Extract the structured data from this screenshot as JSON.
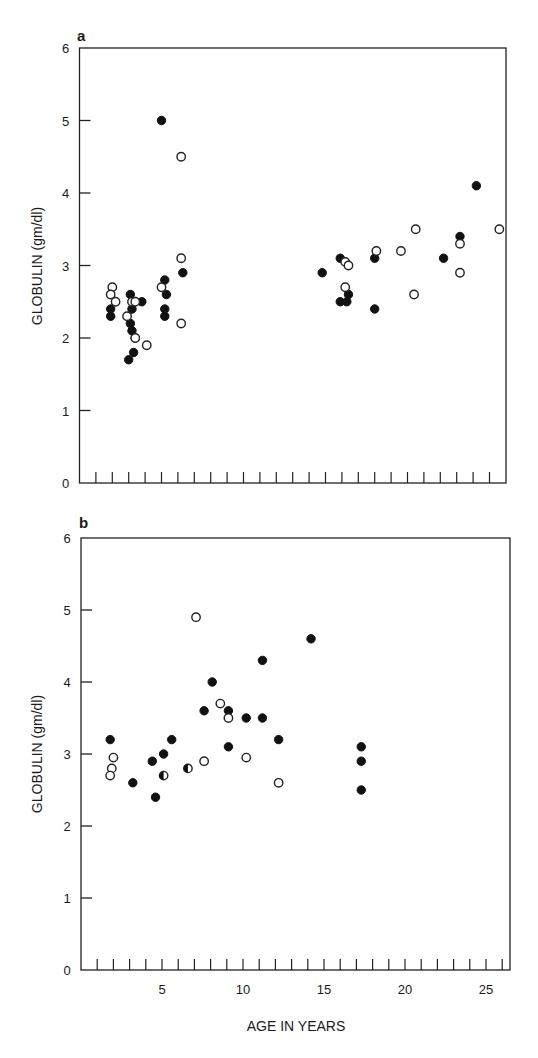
{
  "chart_data": [
    {
      "panel": "a",
      "type": "scatter",
      "title": "a",
      "xlabel": "",
      "ylabel": "GLOBULIN (gm/dl)",
      "xlim": [
        0,
        26.2
      ],
      "ylim": [
        0,
        6
      ],
      "yticks": [
        0,
        1,
        2,
        3,
        4,
        5,
        6
      ],
      "xticks_minor_every": 1,
      "grid": false,
      "series": [
        {
          "name": "filled",
          "marker": "filled-circle",
          "points": [
            [
              1.9,
              2.4
            ],
            [
              1.9,
              2.3
            ],
            [
              3.1,
              2.6
            ],
            [
              3.8,
              2.5
            ],
            [
              3.2,
              2.4
            ],
            [
              3.1,
              2.2
            ],
            [
              3.2,
              2.1
            ],
            [
              3.4,
              2.0
            ],
            [
              3.3,
              1.8
            ],
            [
              3.0,
              1.7
            ],
            [
              5.0,
              5.0
            ],
            [
              6.3,
              2.9
            ],
            [
              5.2,
              2.8
            ],
            [
              5.3,
              2.6
            ],
            [
              5.2,
              2.4
            ],
            [
              5.2,
              2.3
            ],
            [
              14.8,
              2.9
            ],
            [
              15.9,
              3.1
            ],
            [
              16.4,
              2.6
            ],
            [
              15.9,
              2.5
            ],
            [
              16.3,
              2.5
            ],
            [
              18.0,
              3.1
            ],
            [
              18.0,
              2.4
            ],
            [
              22.2,
              3.1
            ],
            [
              23.2,
              3.4
            ],
            [
              24.2,
              4.1
            ]
          ]
        },
        {
          "name": "open",
          "marker": "open-circle",
          "points": [
            [
              2.0,
              2.7
            ],
            [
              1.9,
              2.6
            ],
            [
              2.2,
              2.5
            ],
            [
              3.2,
              2.5
            ],
            [
              3.4,
              2.5
            ],
            [
              2.9,
              2.3
            ],
            [
              3.4,
              2.0
            ],
            [
              4.1,
              1.9
            ],
            [
              6.2,
              4.5
            ],
            [
              6.2,
              3.1
            ],
            [
              5.0,
              2.7
            ],
            [
              6.2,
              2.2
            ],
            [
              16.2,
              3.05
            ],
            [
              16.4,
              3.0
            ],
            [
              16.2,
              2.7
            ],
            [
              18.1,
              3.2
            ],
            [
              19.6,
              3.2
            ],
            [
              20.5,
              3.5
            ],
            [
              20.4,
              2.6
            ],
            [
              23.2,
              3.3
            ],
            [
              23.2,
              2.9
            ],
            [
              25.6,
              3.5
            ]
          ]
        }
      ]
    },
    {
      "panel": "b",
      "type": "scatter",
      "title": "b",
      "xlabel": "AGE IN YEARS",
      "ylabel": "GLOBULIN (gm/dl)",
      "xlim": [
        0,
        26.5
      ],
      "ylim": [
        0,
        6
      ],
      "yticks": [
        0,
        1,
        2,
        3,
        4,
        5,
        6
      ],
      "xtick_labels": [
        5,
        10,
        15,
        20,
        25
      ],
      "grid": false,
      "series": [
        {
          "name": "filled",
          "marker": "filled-circle",
          "points": [
            [
              1.8,
              3.2
            ],
            [
              3.2,
              2.6
            ],
            [
              4.4,
              2.9
            ],
            [
              5.1,
              3.0
            ],
            [
              5.6,
              3.2
            ],
            [
              4.6,
              2.4
            ],
            [
              7.6,
              3.6
            ],
            [
              8.1,
              4.0
            ],
            [
              9.1,
              3.6
            ],
            [
              9.1,
              3.1
            ],
            [
              10.2,
              3.5
            ],
            [
              11.2,
              3.5
            ],
            [
              11.2,
              4.3
            ],
            [
              12.2,
              3.2
            ],
            [
              14.2,
              4.6
            ],
            [
              17.3,
              3.1
            ],
            [
              17.3,
              2.9
            ],
            [
              17.3,
              2.5
            ]
          ]
        },
        {
          "name": "open",
          "marker": "open-circle",
          "points": [
            [
              2.0,
              2.95
            ],
            [
              1.9,
              2.8
            ],
            [
              1.8,
              2.7
            ],
            [
              7.6,
              2.9
            ],
            [
              7.1,
              4.9
            ],
            [
              8.6,
              3.7
            ],
            [
              9.1,
              3.5
            ],
            [
              10.2,
              2.95
            ],
            [
              12.2,
              2.6
            ]
          ]
        },
        {
          "name": "half-filled",
          "marker": "half-circle",
          "points": [
            [
              5.1,
              2.7
            ],
            [
              6.6,
              2.8
            ]
          ]
        }
      ]
    }
  ],
  "labels": {
    "panel_a": "a",
    "panel_b": "b",
    "ylabel": "GLOBULIN (gm/dl)",
    "xlabel": "AGE IN YEARS"
  }
}
